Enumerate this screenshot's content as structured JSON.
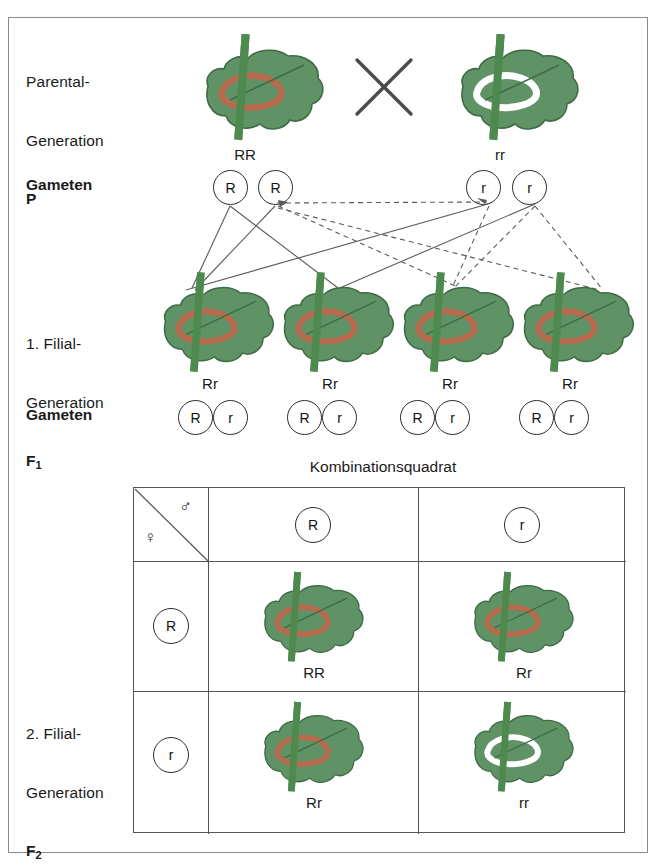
{
  "diagram": {
    "title_center": "Kombinationsquadrat",
    "outer_frame_color": "#8a8a8a",
    "leaf_color": "#5f9265",
    "leaf_outline_color": "#3f6b46",
    "stem_color": "#4e8a4e",
    "red_arc_color": "#b66a4e",
    "white_arc_color": "#ffffff"
  },
  "rows": {
    "parental": {
      "label_lines": [
        "Parental-",
        "Generation"
      ],
      "label_bold": "P",
      "cross_symbol": "X",
      "plants": [
        {
          "genotype": "RR",
          "marking": "red"
        },
        {
          "genotype": "rr",
          "marking": "white"
        }
      ]
    },
    "gameten_p": {
      "label": "Gameten",
      "alleles": [
        "R",
        "R",
        "r",
        "r"
      ]
    },
    "filial1": {
      "label_lines": [
        "1. Filial-",
        "Generation"
      ],
      "label_bold": "F",
      "label_sub": "1",
      "plants": [
        {
          "genotype": "Rr",
          "marking": "red"
        },
        {
          "genotype": "Rr",
          "marking": "red"
        },
        {
          "genotype": "Rr",
          "marking": "red"
        },
        {
          "genotype": "Rr",
          "marking": "red"
        }
      ]
    },
    "gameten_f1": {
      "label": "Gameten",
      "pairs": [
        [
          "R",
          "r"
        ],
        [
          "R",
          "r"
        ],
        [
          "R",
          "r"
        ],
        [
          "R",
          "r"
        ]
      ]
    },
    "filial2": {
      "label_lines": [
        "2. Filial-",
        "Generation"
      ],
      "label_bold": "F",
      "label_sub": "2"
    }
  },
  "punnett": {
    "corner": {
      "male_symbol": "♂",
      "female_symbol": "♀"
    },
    "column_headers": [
      "R",
      "r"
    ],
    "row_headers": [
      "R",
      "r"
    ],
    "cells": [
      [
        {
          "genotype": "RR",
          "marking": "red"
        },
        {
          "genotype": "Rr",
          "marking": "red"
        }
      ],
      [
        {
          "genotype": "Rr",
          "marking": "red"
        },
        {
          "genotype": "rr",
          "marking": "white"
        }
      ]
    ]
  }
}
